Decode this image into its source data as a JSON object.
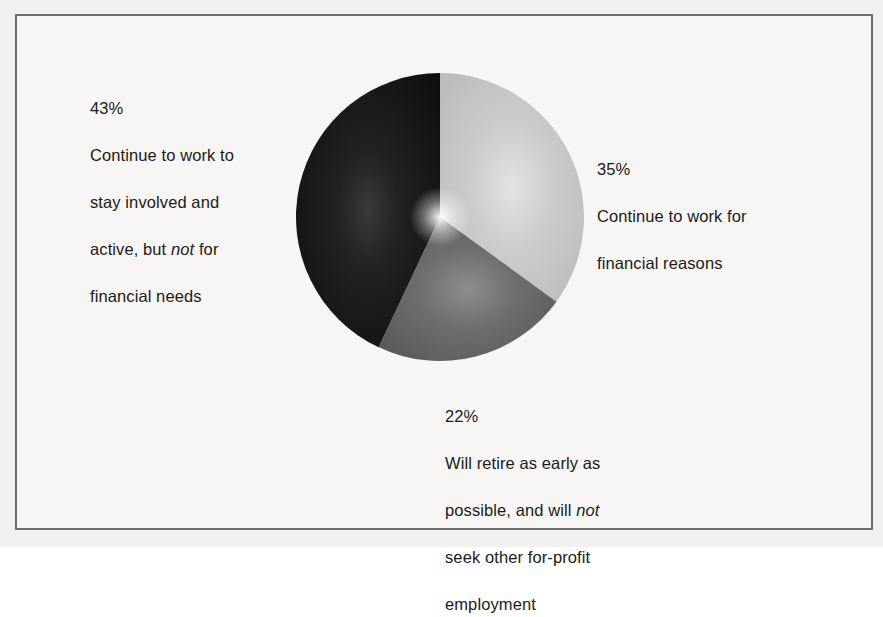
{
  "figure": {
    "background_color": "#f7f6f4",
    "frame_color": "#6d6d70",
    "text_color": "#1b1b1b"
  },
  "chart_data": {
    "type": "pie",
    "title": "",
    "subtitle": "",
    "xlabel": "",
    "ylabel": "",
    "legend_position": "callout-labels",
    "grid": false,
    "total": 100,
    "units": "percent",
    "start_angle_deg": 0,
    "direction": "clockwise",
    "categories": [
      "Continue to work for financial reasons",
      "Will retire as early as possible, and will not seek other for-profit employment",
      "Continue to work to stay involved and active, but not for financial needs"
    ],
    "values": [
      35,
      22,
      43
    ],
    "colors": [
      "#c8c8c8",
      "#6b6b6b",
      "#1d1d1d"
    ],
    "slices": [
      {
        "id": "slice-35",
        "percent": 35,
        "percent_label": "35%",
        "label": "Continue to work for financial reasons",
        "color": "#c8c8c8",
        "color_dark": "#b4b4b4",
        "start_deg": 0,
        "end_deg": 126
      },
      {
        "id": "slice-22",
        "percent": 22,
        "percent_label": "22%",
        "label": "Will retire as early as possible, and will not seek other for-profit employment",
        "color": "#6b6b6b",
        "color_dark": "#535353",
        "start_deg": 126,
        "end_deg": 205.2
      },
      {
        "id": "slice-43",
        "percent": 43,
        "percent_label": "43%",
        "label": "Continue to work to stay involved and active, but not for financial needs",
        "color": "#1d1d1d",
        "color_dark": "#0a0a0a",
        "start_deg": 205.2,
        "end_deg": 360
      }
    ]
  },
  "callouts": {
    "left": {
      "percent": "43%",
      "line1": "Continue to work to",
      "line2": "stay involved and",
      "line3_a": "active, but ",
      "line3_em": "not",
      "line3_b": " for",
      "line4": "financial needs"
    },
    "right": {
      "percent": "35%",
      "line1": "Continue to work for",
      "line2": "financial reasons"
    },
    "bottom": {
      "percent": "22%",
      "line1": "Will retire as early as",
      "line2_a": "possible, and will ",
      "line2_em": "not",
      "line3": "seek other for-profit",
      "line4": "employment"
    }
  }
}
